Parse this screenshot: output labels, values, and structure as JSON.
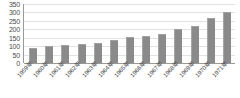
{
  "chart_data": {
    "type": "bar",
    "title": "",
    "subtitle": "",
    "xlabel": "",
    "ylabel": "",
    "categories": [
      "1959年",
      "1960年",
      "1961年",
      "1962年",
      "1963年",
      "1964年",
      "1965年",
      "1966年",
      "1967年",
      "1968年",
      "1969年",
      "1970年",
      "1971年"
    ],
    "values": [
      90,
      100,
      105,
      110,
      120,
      135,
      152,
      160,
      170,
      203,
      222,
      265,
      300
    ],
    "ylim": [
      0,
      350
    ],
    "ytick_labels": [
      "350",
      "300",
      "250",
      "200",
      "150",
      "100",
      "50",
      "0"
    ],
    "ytick_values": [
      350,
      300,
      250,
      200,
      150,
      100,
      50,
      0
    ],
    "grid": true,
    "legend": false,
    "legend_position": "none",
    "series": [
      {
        "name": "",
        "values": [
          90,
          100,
          105,
          110,
          120,
          135,
          152,
          160,
          170,
          203,
          222,
          265,
          300
        ]
      }
    ],
    "colors": {
      "bar": "#8a8a8a",
      "gridline": "#e2e2e2",
      "axis": "#9a9a9a",
      "tick_text": "#4a4a4a",
      "background": "#ffffff"
    }
  }
}
